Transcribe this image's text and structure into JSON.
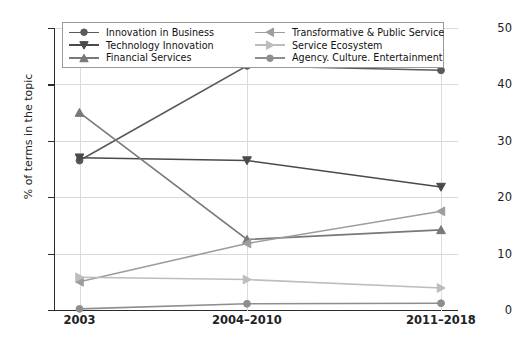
{
  "chart_data": {
    "type": "line",
    "title": "",
    "xlabel": "",
    "ylabel": "% of terms in the topic",
    "categories": [
      "2003",
      "2004–2010",
      "2011–2018"
    ],
    "ylim": [
      0,
      50
    ],
    "yticks": [
      0,
      10,
      20,
      30,
      40,
      50
    ],
    "grid": true,
    "legend_position": "upper center",
    "series": [
      {
        "name": "Innovation in Business",
        "values": [
          26.5,
          43.3,
          42.5
        ],
        "marker": "circle",
        "color": "#5a5a5a"
      },
      {
        "name": "Technology Innovation",
        "values": [
          27.0,
          26.5,
          21.8
        ],
        "marker": "triangle-down",
        "color": "#4a4a4a"
      },
      {
        "name": "Financial Services",
        "values": [
          35.0,
          12.5,
          14.2
        ],
        "marker": "triangle-up",
        "color": "#787878"
      },
      {
        "name": "Transformative & Public Service",
        "values": [
          5.0,
          11.8,
          17.5
        ],
        "marker": "triangle-left",
        "color": "#9d9d9d"
      },
      {
        "name": "Service Ecosystem",
        "values": [
          5.8,
          5.4,
          3.9
        ],
        "marker": "triangle-right",
        "color": "#bdbdbd"
      },
      {
        "name": "Agency. Culture. Entertainment",
        "values": [
          0.2,
          1.1,
          1.2
        ],
        "marker": "circle",
        "color": "#8e8e8e"
      }
    ]
  },
  "axes": {
    "y_title": "% of terms in the topic",
    "y_tick_labels": [
      "50",
      "40",
      "30",
      "20",
      "10",
      "0"
    ],
    "x_tick_labels": [
      "2003",
      "2004–2010",
      "2011–2018"
    ]
  },
  "legend": {
    "left_column": [
      {
        "label": "Innovation in Business",
        "marker": "circle-marker",
        "color": "#5a5a5a"
      },
      {
        "label": "Technology Innovation",
        "marker": "triangle-down-marker",
        "color": "#4a4a4a"
      },
      {
        "label": "Financial Services",
        "marker": "triangle-up-marker",
        "color": "#787878"
      }
    ],
    "right_column": [
      {
        "label": "Transformative & Public Service",
        "marker": "triangle-left-marker",
        "color": "#9d9d9d"
      },
      {
        "label": "Service Ecosystem",
        "marker": "triangle-right-marker",
        "color": "#bdbdbd"
      },
      {
        "label": "Agency. Culture. Entertainment",
        "marker": "circle-marker",
        "color": "#8e8e8e"
      }
    ]
  },
  "colors": {
    "axis": "#2b2b2b",
    "grid": "#d9d9d9",
    "background": "#ffffff"
  }
}
